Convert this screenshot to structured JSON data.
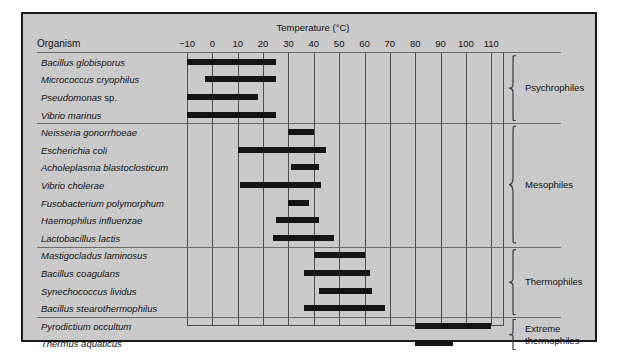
{
  "chart": {
    "axis_title": "Temperature (°C)",
    "organism_header": "Organism"
  },
  "chart_data": {
    "type": "bar",
    "orientation": "horizontal-range",
    "title": "",
    "xlabel": "Temperature (°C)",
    "ylabel": "Organism",
    "xlim": [
      -10,
      115
    ],
    "xticks": [
      -10,
      0,
      10,
      20,
      30,
      40,
      50,
      60,
      70,
      80,
      90,
      100,
      110
    ],
    "xtick_labels": [
      "−10",
      "0",
      "10",
      "20",
      "30",
      "40",
      "50",
      "60",
      "70",
      "80",
      "90",
      "100",
      "110"
    ],
    "grid": true,
    "legend": "right-braces",
    "groups": [
      {
        "label": "Psychrophiles",
        "rows": [
          {
            "organism": "Bacillus globisporus",
            "italic_suffix": "",
            "min": -10,
            "max": 25
          },
          {
            "organism": "Micrococcus cryophilus",
            "italic_suffix": "",
            "min": -3,
            "max": 25
          },
          {
            "organism": "Pseudomonas",
            "italic_suffix": " sp.",
            "min": -10,
            "max": 18
          },
          {
            "organism": "Vibrio marinus",
            "italic_suffix": "",
            "min": -10,
            "max": 25
          }
        ]
      },
      {
        "label": "Mesophiles",
        "rows": [
          {
            "organism": "Neisseria gonorrhoeae",
            "italic_suffix": "",
            "min": 30,
            "max": 40
          },
          {
            "organism": "Escherichia coli",
            "italic_suffix": "",
            "min": 10,
            "max": 45
          },
          {
            "organism": "Acholeplasma blastoclosticum",
            "italic_suffix": "",
            "min": 31,
            "max": 42
          },
          {
            "organism": "Vibrio cholerae",
            "italic_suffix": "",
            "min": 11,
            "max": 43
          },
          {
            "organism": "Fusobacterium polymorphum",
            "italic_suffix": "",
            "min": 30,
            "max": 38
          },
          {
            "organism": "Haemophilus influenzae",
            "italic_suffix": "",
            "min": 25,
            "max": 42
          },
          {
            "organism": "Lactobacillus lactis",
            "italic_suffix": "",
            "min": 24,
            "max": 48
          }
        ]
      },
      {
        "label": "Thermophiles",
        "rows": [
          {
            "organism": "Mastigocladus laminosus",
            "italic_suffix": "",
            "min": 40,
            "max": 60
          },
          {
            "organism": "Bacillus coagulans",
            "italic_suffix": "",
            "min": 36,
            "max": 62
          },
          {
            "organism": "Synechococcus lividus",
            "italic_suffix": "",
            "min": 42,
            "max": 63
          },
          {
            "organism": "Bacillus stearothermophilus",
            "italic_suffix": "",
            "min": 36,
            "max": 68
          }
        ]
      },
      {
        "label": "Extreme\nthermophiles",
        "rows": [
          {
            "organism": "Pyrodictium occultum",
            "italic_suffix": "",
            "min": 80,
            "max": 110
          },
          {
            "organism": "Thermus aquaticus",
            "italic_suffix": "",
            "min": 80,
            "max": 95
          }
        ]
      }
    ]
  }
}
